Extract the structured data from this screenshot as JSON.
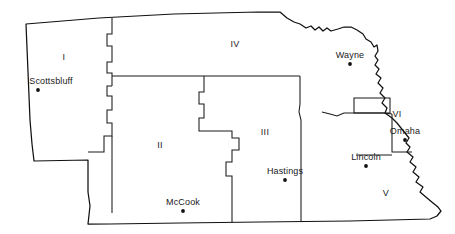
{
  "map": {
    "title": "Nebraska Regions Map",
    "subject": "Nebraska",
    "style": {
      "background_color": "#ffffff",
      "outline_color": "#111111",
      "boundary_color": "#1a1a1a",
      "label_color": "#1a1a1a",
      "dot_color": "#111111"
    },
    "regions": [
      {
        "id": "region-1",
        "label": "I",
        "label_x": 64,
        "label_y": 57
      },
      {
        "id": "region-2",
        "label": "II",
        "label_x": 160,
        "label_y": 145
      },
      {
        "id": "region-3",
        "label": "III",
        "label_x": 265,
        "label_y": 132
      },
      {
        "id": "region-4",
        "label": "IV",
        "label_x": 235,
        "label_y": 44
      },
      {
        "id": "region-5",
        "label": "V",
        "label_x": 386,
        "label_y": 193
      },
      {
        "id": "region-6",
        "label": "VI",
        "label_x": 397,
        "label_y": 114
      }
    ],
    "cities": [
      {
        "id": "city-scottsbluff",
        "label": "Scottsbluff",
        "label_x": 51,
        "label_y": 76,
        "dot_x": 38,
        "dot_y": 90
      },
      {
        "id": "city-wayne",
        "label": "Wayne",
        "label_x": 350,
        "label_y": 50,
        "dot_x": 350,
        "dot_y": 64
      },
      {
        "id": "city-omaha",
        "label": "Omaha",
        "label_x": 405,
        "label_y": 126,
        "dot_x": 405,
        "dot_y": 140
      },
      {
        "id": "city-lincoln",
        "label": "Lincoln",
        "label_x": 366,
        "label_y": 152,
        "dot_x": 366,
        "dot_y": 166
      },
      {
        "id": "city-hastings",
        "label": "Hastings",
        "label_x": 285,
        "label_y": 166,
        "dot_x": 285,
        "dot_y": 180
      },
      {
        "id": "city-mccook",
        "label": "McCook",
        "label_x": 183,
        "label_y": 197,
        "dot_x": 183,
        "dot_y": 211
      }
    ],
    "geometry": {
      "state_outline": "M 26,24 L 99,18 L 174,14 L 258,12 L 280,12 L 287,18 L 294,22 L 300,24 L 306,28 L 311,26 L 315,30 L 319,27 L 323,31 L 327,28 L 331,31 L 338,29 L 344,27 L 351,27 L 357,30 L 363,34 L 366,39 L 371,42 L 374,47 L 377,45 L 378,51 L 375,56 L 378,60 L 375,65 L 379,69 L 376,74 L 381,78 L 378,83 L 383,88 L 380,93 L 385,98 L 382,103 L 387,108 L 385,113 L 392,118 L 397,123 L 401,128 L 405,133 L 409,138 L 406,143 L 410,147 L 407,152 L 413,157 L 410,162 L 416,167 L 413,172 L 419,177 L 416,182 L 423,187 L 420,192 L 427,198 L 433,203 L 438,207 L 441,211 L 437,216 L 430,219 L 350,221 L 260,222 L 180,223 L 110,224 L 88,224 L 90,206 L 88,192 L 88,176 L 88,160 L 34,161 L 32,144 L 30,120 L 29,96 L 28,72 L 27,48 Z",
      "boundaries": [
        "M 112,18 L 112,34 L 107,34 L 107,46 L 112,46 L 112,62 L 107,62 L 107,73 L 112,73 L 112,86",
        "M 112,76 L 152,76 L 196,76 L 248,76 L 300,76",
        "M 112,86 L 107,86 L 107,96 L 112,96 L 112,110 L 107,110 L 107,123 L 112,123 L 112,136 L 104,136 L 104,152 L 88,152",
        "M 112,136 L 112,152 L 112,176 L 112,200 L 112,213",
        "M 204,76 L 204,92 L 199,92 L 199,104 L 204,104 L 204,118 L 199,118 L 199,131 L 232,131 L 232,138 L 239,138 L 239,150 L 232,150 L 232,162 L 226,162 L 226,176 L 232,176 L 232,196 L 232,222",
        "M 300,76 L 300,92 L 300,104 L 299,112 L 301,120 L 301,140 L 301,170 L 301,196 L 301,221",
        "M 354,98 L 354,113 L 390,113 L 390,98 L 366,98 L 360,98 Z",
        "M 354,113 L 344,113 L 337,116 L 330,114 L 322,112",
        "M 354,113 L 362,113 L 372,113 L 384,113 L 392,114",
        "M 392,114 L 392,125 L 392,140 L 392,152 L 402,152 L 412,152",
        "M 356,155 L 366,155 L 378,155 L 392,155"
      ],
      "river_border_note": "Missouri River forms the northern and eastern borders"
    }
  }
}
